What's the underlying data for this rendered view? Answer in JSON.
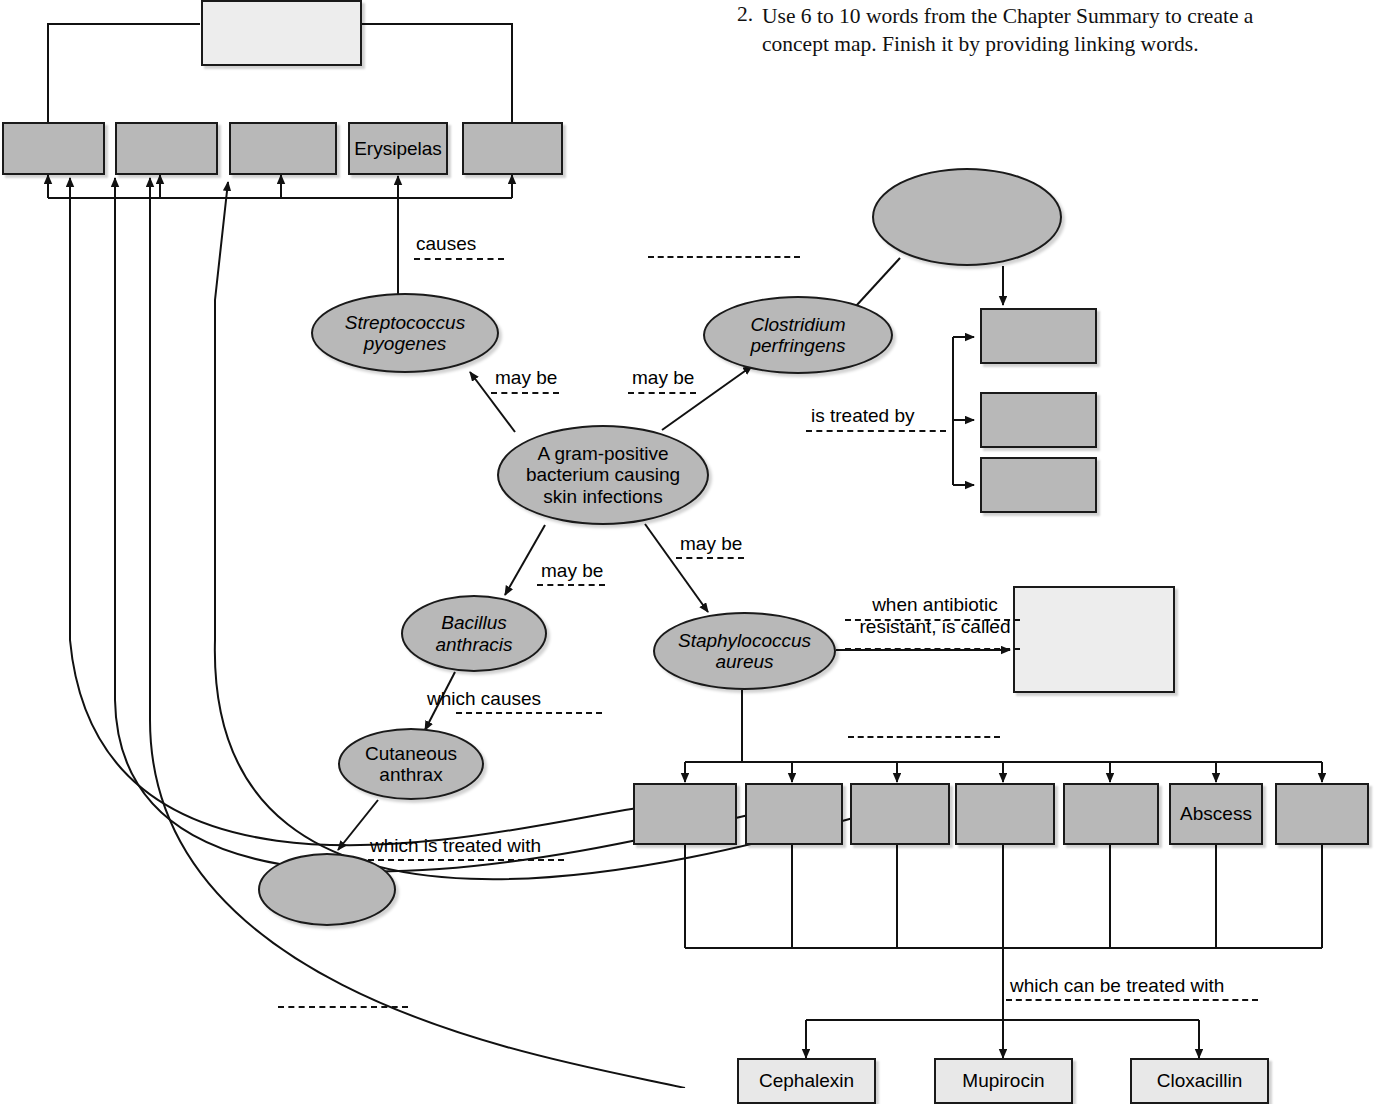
{
  "question": {
    "number": "2.",
    "text": "Use 6 to 10 words from the Chapter Summary to create a\nconcept map. Finish it by providing linking words."
  },
  "colors": {
    "node_fill": "#b8b8b8",
    "blank_fill": "#ededed",
    "drug_fill": "#e8e8e8",
    "stroke": "#1a1a1a",
    "text": "#000000"
  },
  "concept_map": {
    "title": "Gram-positive skin infection concept map",
    "nodes": {
      "top_blank_box": {
        "label": "",
        "shape": "rect",
        "filled": false
      },
      "disease_row": [
        {
          "label": "",
          "shape": "rect",
          "filled": true
        },
        {
          "label": "",
          "shape": "rect",
          "filled": true
        },
        {
          "label": "",
          "shape": "rect",
          "filled": true
        },
        {
          "label": "Erysipelas",
          "shape": "rect",
          "filled": true
        },
        {
          "label": "",
          "shape": "rect",
          "filled": true
        }
      ],
      "streptococcus": {
        "label": "Streptococcus\npyogenes",
        "shape": "ellipse",
        "italic": true
      },
      "clostridium": {
        "label": "Clostridium\nperfringens",
        "shape": "ellipse",
        "italic": true
      },
      "top_right_blank_ellipse": {
        "label": "",
        "shape": "ellipse",
        "italic": false
      },
      "central": {
        "label": "A gram-positive\nbacterium causing\nskin infections",
        "shape": "ellipse",
        "italic": false
      },
      "bacillus": {
        "label": "Bacillus\nanthracis",
        "shape": "ellipse",
        "italic": true
      },
      "staphylococcus": {
        "label": "Staphylococcus\naureus",
        "shape": "ellipse",
        "italic": true
      },
      "cutaneous_anthrax": {
        "label": "Cutaneous\nanthrax",
        "shape": "ellipse",
        "italic": false
      },
      "anthrax_treatment_blank_ellipse": {
        "label": "",
        "shape": "ellipse",
        "italic": false
      },
      "mrsa_blank_box": {
        "label": "",
        "shape": "rect",
        "filled": false
      },
      "treated_by_boxes": [
        {
          "label": "",
          "shape": "rect",
          "filled": true
        },
        {
          "label": "",
          "shape": "rect",
          "filled": true
        },
        {
          "label": "",
          "shape": "rect",
          "filled": true
        }
      ],
      "staph_condition_row": [
        {
          "label": "",
          "shape": "rect",
          "filled": true
        },
        {
          "label": "",
          "shape": "rect",
          "filled": true
        },
        {
          "label": "",
          "shape": "rect",
          "filled": true
        },
        {
          "label": "",
          "shape": "rect",
          "filled": true
        },
        {
          "label": "",
          "shape": "rect",
          "filled": true
        },
        {
          "label": "Abscess",
          "shape": "rect",
          "filled": true
        },
        {
          "label": "",
          "shape": "rect",
          "filled": true
        }
      ],
      "drugs": [
        {
          "label": "Cephalexin",
          "shape": "rect"
        },
        {
          "label": "Mupirocin",
          "shape": "rect"
        },
        {
          "label": "Cloxacillin",
          "shape": "rect"
        }
      ]
    },
    "linking_words": {
      "causes": "causes",
      "may_be_strep": "may be",
      "may_be_clostridium": "may be",
      "may_be_bacillus": "may be",
      "may_be_staph": "may be",
      "is_treated_by": "is treated by",
      "which_causes": "which causes",
      "which_is_treated_with": "which is treated with",
      "when_antibiotic_resistant": "when antibiotic\nresistant, is called",
      "which_can_be_treated_with": "which can be treated with"
    },
    "blank_linking_lines": [
      {
        "id": "blank-above-clostridium",
        "label": ""
      },
      {
        "id": "blank-above-staph-row",
        "label": ""
      },
      {
        "id": "blank-bottom-left",
        "label": ""
      }
    ]
  }
}
